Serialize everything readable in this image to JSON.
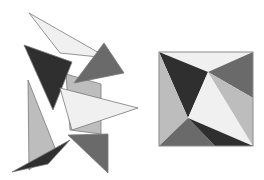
{
  "colors": {
    "lightest": "#f0f0f0",
    "light": "#bdbdbd",
    "medium": "#8c8c8c",
    "mid_dark": "#6a6a6a",
    "dark": "#2f2f2f",
    "outline": "#7a7a7a"
  },
  "scattered_figure": {
    "label": "scattered-pieces",
    "pieces": [
      {
        "name": "light-long-triangle",
        "shade": "lightest",
        "points": "29,13 108,58 60,53"
      },
      {
        "name": "parallelogram-behind",
        "shade": "light",
        "points": "66,74 101,84 101,134 70,130"
      },
      {
        "name": "dark-triangle",
        "shade": "dark",
        "points": "24,45 72,62 53,110"
      },
      {
        "name": "mid-dark-triangle-top",
        "shade": "mid_dark",
        "points": "104,43 124,73 74,83"
      },
      {
        "name": "light-big-triangle",
        "shade": "lightest",
        "points": "60,88 138,108 72,130"
      },
      {
        "name": "light-gray-tall-triangle",
        "shade": "light",
        "points": "28,80 55,148 29,170"
      },
      {
        "name": "dark-thin-triangle",
        "shade": "dark",
        "points": "12,172 70,140 48,164"
      },
      {
        "name": "mid-dark-triangle-bottom",
        "shade": "mid_dark",
        "points": "68,135 108,134 108,173"
      }
    ]
  },
  "assembled_square": {
    "label": "assembled-square",
    "bounds": {
      "x": 159,
      "y": 52,
      "w": 94,
      "h": 94
    },
    "pieces": [
      {
        "name": "top-light-triangle",
        "shade": "lightest",
        "points": "159,52 253,52 208,72"
      },
      {
        "name": "top-left-dark-triangle",
        "shade": "dark",
        "points": "159,52 208,72 188,118"
      },
      {
        "name": "top-right-mid-triangle",
        "shade": "mid_dark",
        "points": "253,52 253,98 208,72"
      },
      {
        "name": "left-light-triangle",
        "shade": "light",
        "points": "159,52 188,118 159,146"
      },
      {
        "name": "center-light-triangle",
        "shade": "lightest",
        "points": "208,72 253,146 188,118"
      },
      {
        "name": "right-gray-triangle",
        "shade": "light",
        "points": "208,72 253,98 253,146"
      },
      {
        "name": "bottom-mid-triangle",
        "shade": "mid_dark",
        "points": "159,146 188,118 215,146"
      },
      {
        "name": "bottom-dark-triangle",
        "shade": "dark",
        "points": "188,118 253,146 215,146"
      }
    ]
  }
}
